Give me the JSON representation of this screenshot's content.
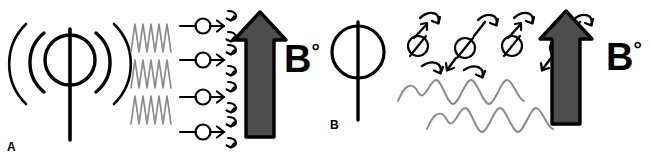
{
  "figure": {
    "background_color": "#ffffff",
    "width": 651,
    "height": 158,
    "ink_color": "#000000",
    "wave_color": "#808080",
    "arrow_fill_color": "#4d4d4d",
    "arrow_stroke_color": "#000000"
  },
  "panels": [
    {
      "id": "A",
      "label": "A",
      "caption": "A",
      "field_label_letter": "B",
      "field_label_superscript": "°",
      "field_label_full": "B°",
      "elements": {
        "coil": {
          "name": "transmitting-coil-symbol",
          "radiating_arc_pairs": 2,
          "description": "circle with vertical stem and radiating arcs on both sides"
        },
        "rf_waves": {
          "name": "rf-zigzag-waves",
          "rows": 3,
          "cycles_per_row": 5,
          "style": "zigzag",
          "color": "#808080"
        },
        "spins": {
          "name": "spin-row",
          "count": 4,
          "marker": "circle-with-horizontal-axis",
          "arrow_direction": "right",
          "curl_arrows": 2
        },
        "field_arrow": {
          "name": "b0-field-arrow",
          "direction": "up",
          "fill": "#4d4d4d"
        }
      }
    },
    {
      "id": "B",
      "label": "B",
      "caption": "B",
      "field_label_letter": "B",
      "field_label_superscript": "°",
      "field_label_full": "B°",
      "elements": {
        "coil": {
          "name": "receiving-coil-symbol",
          "radiating_arc_pairs": 0,
          "description": "circle with vertical stem, no radiating arcs"
        },
        "spins": {
          "name": "precessing-spin-group",
          "count": 4,
          "marker": "circle-with-tilted-axis",
          "tilt_degrees": 35,
          "curl_arrows": 8
        },
        "signal_waves": {
          "name": "emitted-sine-waves",
          "rows": 2,
          "cycles_per_row": 4,
          "style": "sine",
          "color": "#808080"
        },
        "field_arrow": {
          "name": "b0-field-arrow",
          "direction": "up",
          "fill": "#4d4d4d"
        }
      }
    }
  ]
}
